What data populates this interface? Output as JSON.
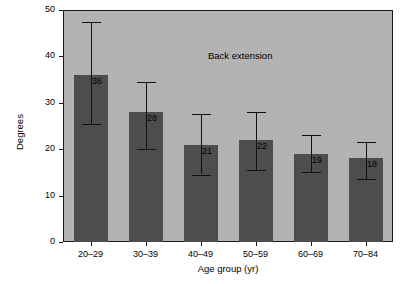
{
  "chart_data": {
    "type": "bar",
    "title": "",
    "annotation": "Back extension",
    "xlabel": "Age group (yr)",
    "ylabel": "Degrees",
    "categories": [
      "20–29",
      "30–39",
      "40–49",
      "50–59",
      "60–69",
      "70–84"
    ],
    "values": [
      36,
      28,
      21,
      22,
      19,
      18
    ],
    "value_labels": [
      "36",
      "28",
      "21",
      "22",
      "19",
      "18"
    ],
    "errors_low": [
      25.5,
      20.0,
      14.5,
      15.5,
      15.0,
      13.5
    ],
    "errors_high": [
      47.5,
      34.5,
      27.5,
      28.0,
      23.0,
      21.5
    ],
    "ylim": [
      0,
      50
    ],
    "yticks": [
      0,
      10,
      20,
      30,
      40,
      50
    ],
    "ytick_labels": [
      "0",
      "10",
      "20",
      "30",
      "40",
      "50"
    ],
    "grid": false,
    "legend": "none",
    "bar_color": "#4d4d4d",
    "plot_background": "#b3b3b3",
    "axis_color": "#1a1a1a"
  }
}
